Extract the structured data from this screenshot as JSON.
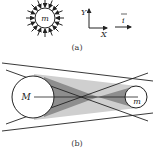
{
  "figure_a": {
    "caption": "(a)",
    "mass_label": "m",
    "axis_y_label": "Y",
    "axis_x_label": "X",
    "vector_label": "i",
    "arrow_count": 16,
    "arrow_direction": "inward"
  },
  "figure_b": {
    "caption": "(b)",
    "large_body_label": "M",
    "small_body_label": "m",
    "shade_light": "#c8c8c8",
    "shade_dark": "#8a8a8a"
  },
  "colors": {
    "stroke": "#222222",
    "background": "#ffffff"
  }
}
